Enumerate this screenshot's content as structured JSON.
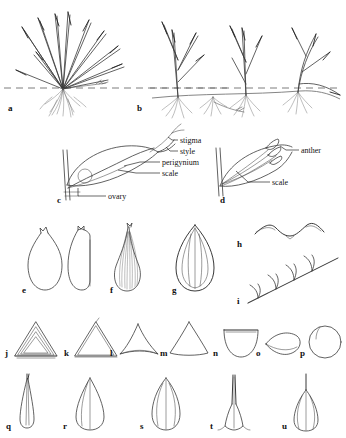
{
  "figure": {
    "background_color": "#ffffff",
    "ink_color": "#3a3a3a",
    "panels": [
      {
        "id": "a",
        "label": "a",
        "x": 8,
        "y": 104,
        "subject": "caespitose (tufted) habit with fibrous roots"
      },
      {
        "id": "b",
        "label": "b",
        "x": 137,
        "y": 104,
        "subject": "rhizomatous habit with creeping rhizome"
      },
      {
        "id": "c",
        "label": "c",
        "x": 57,
        "y": 196,
        "subject": "pistillate flower with perigynium, labeled"
      },
      {
        "id": "d",
        "label": "d",
        "x": 220,
        "y": 196,
        "subject": "staminate flower with anthers, labeled"
      },
      {
        "id": "e",
        "label": "e",
        "x": 22,
        "y": 292,
        "subject": "perigynium outlines, nerveless"
      },
      {
        "id": "f",
        "label": "f",
        "x": 110,
        "y": 292,
        "subject": "perigynium, strongly nerved with beak"
      },
      {
        "id": "g",
        "label": "g",
        "x": 174,
        "y": 292,
        "subject": "perigynium, few-nerved beakless"
      },
      {
        "id": "h",
        "label": "h",
        "x": 237,
        "y": 243,
        "subject": "perigynium beak margin detail"
      },
      {
        "id": "i",
        "label": "i",
        "x": 237,
        "y": 300,
        "subject": "hispid / ciliate margin detail"
      },
      {
        "id": "j",
        "label": "j",
        "x": 6,
        "y": 356,
        "subject": "achene cross-section, trigonous concave"
      },
      {
        "id": "k",
        "label": "k",
        "x": 64,
        "y": 356,
        "subject": "achene cross-section, trigonous"
      },
      {
        "id": "l",
        "label": "l",
        "x": 122,
        "y": 356,
        "subject": "achene cross-section, triangular concave"
      },
      {
        "id": "m",
        "label": "m",
        "x": 166,
        "y": 356,
        "subject": "achene cross-section, rounded-trigonous"
      },
      {
        "id": "n",
        "label": "n",
        "x": 212,
        "y": 356,
        "subject": "achene cross-section, plano-convex"
      },
      {
        "id": "o",
        "label": "o",
        "x": 257,
        "y": 356,
        "subject": "achene cross-section, lenticular"
      },
      {
        "id": "p",
        "label": "p",
        "x": 300,
        "y": 356,
        "subject": "achene cross-section, circular"
      },
      {
        "id": "q",
        "label": "q",
        "x": 6,
        "y": 425,
        "subject": "scale, narrowly lanceolate"
      },
      {
        "id": "r",
        "label": "r",
        "x": 70,
        "y": 425,
        "subject": "scale, ovate-lanceolate"
      },
      {
        "id": "s",
        "label": "s",
        "x": 146,
        "y": 425,
        "subject": "scale, elliptic"
      },
      {
        "id": "t",
        "label": "t",
        "x": 210,
        "y": 425,
        "subject": "scale with long awn"
      },
      {
        "id": "u",
        "label": "u",
        "x": 278,
        "y": 425,
        "subject": "scale with short awn"
      }
    ],
    "callouts": [
      {
        "id": "stigma",
        "text": "stigma",
        "x": 180,
        "y": 142
      },
      {
        "id": "style",
        "text": "style",
        "x": 180,
        "y": 153
      },
      {
        "id": "perigynium",
        "text": "perigynium",
        "x": 163,
        "y": 164
      },
      {
        "id": "scale",
        "text": "scale",
        "x": 163,
        "y": 175
      },
      {
        "id": "ovary",
        "text": "ovary",
        "x": 108,
        "y": 198
      },
      {
        "id": "anther",
        "text": "anther",
        "x": 301,
        "y": 152
      },
      {
        "id": "scale_d",
        "text": "scale",
        "x": 272,
        "y": 184
      }
    ]
  }
}
